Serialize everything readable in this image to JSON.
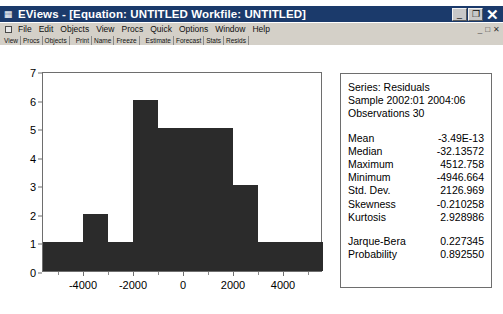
{
  "window": {
    "icon": "eviews-icon",
    "title": "EViews - [Equation: UNTITLED   Workfile: UNTITLED]",
    "minimize_label": "_",
    "restore_label": "❐",
    "close_label": "✕"
  },
  "menubar": {
    "doc_icon": "document-icon",
    "items": [
      {
        "label": "File"
      },
      {
        "label": "Edit"
      },
      {
        "label": "Objects"
      },
      {
        "label": "View"
      },
      {
        "label": "Procs"
      },
      {
        "label": "Quick"
      },
      {
        "label": "Options"
      },
      {
        "label": "Window"
      },
      {
        "label": "Help"
      }
    ],
    "mdi_minimize": "_",
    "mdi_restore": "□",
    "mdi_close": "✕"
  },
  "objectbar": {
    "groups": [
      [
        "View",
        "Procs",
        "Objects"
      ],
      [
        "Print",
        "Name",
        "Freeze"
      ],
      [
        "Estimate",
        "Forecast",
        "Stats",
        "Resids"
      ]
    ]
  },
  "stats": {
    "series_line": "Series: Residuals",
    "sample_line": "Sample 2002:01 2004:06",
    "observations_line": "Observations 30",
    "rows": [
      {
        "label": "Mean",
        "value": "-3.49E-13"
      },
      {
        "label": "Median",
        "value": "-32.13572"
      },
      {
        "label": "Maximum",
        "value": "4512.758"
      },
      {
        "label": "Minimum",
        "value": "-4946.664"
      },
      {
        "label": "Std. Dev.",
        "value": "2126.969"
      },
      {
        "label": "Skewness",
        "value": "-0.210258"
      },
      {
        "label": "Kurtosis",
        "value": "2.928986"
      }
    ],
    "test_rows": [
      {
        "label": "Jarque-Bera",
        "value": "0.227345"
      },
      {
        "label": "Probability",
        "value": "0.892550"
      }
    ]
  },
  "chart_data": {
    "type": "bar",
    "title": "",
    "xlabel": "",
    "ylabel": "",
    "grid": false,
    "legend": false,
    "bar_color": "#2b2b2b",
    "xlim": [
      -5600,
      5600
    ],
    "ylim": [
      0,
      7
    ],
    "x_ticks": [
      -4000,
      -2000,
      0,
      2000,
      4000
    ],
    "x_tick_labels": [
      "-4000",
      "-2000",
      "0",
      "2000",
      "4000"
    ],
    "x_minor_ticks": [
      -5000,
      -3000,
      -1000,
      1000,
      3000,
      5000
    ],
    "y_ticks": [
      0,
      1,
      2,
      3,
      4,
      5,
      6,
      7
    ],
    "y_tick_labels": [
      "0",
      "1",
      "2",
      "3",
      "4",
      "5",
      "6",
      "7"
    ],
    "bin_width": 1000,
    "bins": [
      {
        "lo": -5600,
        "hi": -4000,
        "count": 1
      },
      {
        "lo": -4000,
        "hi": -3000,
        "count": 2
      },
      {
        "lo": -3000,
        "hi": -2000,
        "count": 1
      },
      {
        "lo": -2000,
        "hi": -1000,
        "count": 6
      },
      {
        "lo": -1000,
        "hi": 0,
        "count": 5
      },
      {
        "lo": 0,
        "hi": 1000,
        "count": 5
      },
      {
        "lo": 1000,
        "hi": 2000,
        "count": 5
      },
      {
        "lo": 2000,
        "hi": 3000,
        "count": 3
      },
      {
        "lo": 3000,
        "hi": 4000,
        "count": 1
      },
      {
        "lo": 4000,
        "hi": 5600,
        "count": 1
      }
    ],
    "categories": [
      "-5600..-4000",
      "-4000..-3000",
      "-3000..-2000",
      "-2000..-1000",
      "-1000..0",
      "0..1000",
      "1000..2000",
      "2000..3000",
      "3000..4000",
      "4000..5600"
    ],
    "values": [
      1,
      2,
      1,
      6,
      5,
      5,
      5,
      3,
      1,
      1
    ]
  }
}
